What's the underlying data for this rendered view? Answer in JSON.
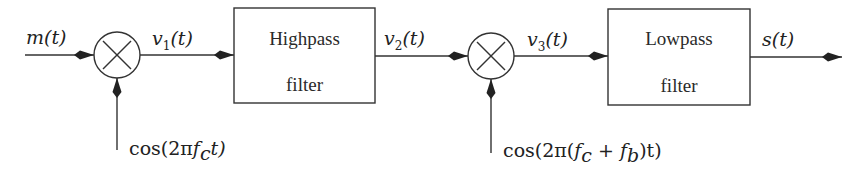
{
  "diagram": {
    "type": "block-diagram",
    "colors": {
      "stroke": "#333333",
      "text": "#222222",
      "background": "#ffffff"
    },
    "signals": {
      "input": "m(t)",
      "v1": "v",
      "v1_sub": "1",
      "v1_tail": "(t)",
      "v2": "v",
      "v2_sub": "2",
      "v2_tail": "(t)",
      "v3": "v",
      "v3_sub": "3",
      "v3_tail": "(t)",
      "output": "s(t)"
    },
    "oscillators": {
      "osc1_prefix": "cos(2π",
      "osc1_f": "f",
      "osc1_sub": "c",
      "osc1_suffix": "t)",
      "osc2_prefix": "cos(2π(",
      "osc2_f1": "f",
      "osc2_sub1": "c",
      "osc2_plus": " + ",
      "osc2_f2": "f",
      "osc2_sub2": "b",
      "osc2_suffix": ")t)"
    },
    "blocks": [
      {
        "id": "highpass",
        "line1": "Highpass",
        "line2": "filter"
      },
      {
        "id": "lowpass",
        "line1": "Lowpass",
        "line2": "filter"
      }
    ],
    "mixers": [
      {
        "id": "mixer-1",
        "symbol": "×"
      },
      {
        "id": "mixer-2",
        "symbol": "×"
      }
    ]
  }
}
